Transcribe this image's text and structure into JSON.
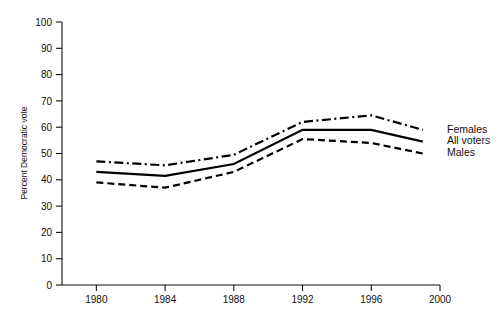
{
  "chart_data": {
    "type": "line",
    "title": "",
    "xlabel": "",
    "ylabel": "Percent Democratic vote",
    "x": [
      1980,
      1984,
      1988,
      1992,
      1996,
      1999
    ],
    "xlim": [
      1978,
      2000
    ],
    "ylim": [
      0,
      100
    ],
    "grid": false,
    "legend_position": "right-of-plot-end-labels",
    "xticks": [
      "1980",
      "1984",
      "1988",
      "1992",
      "1996",
      "2000"
    ],
    "xtick_values": [
      1980,
      1984,
      1988,
      1992,
      1996,
      2000
    ],
    "yticks": [
      "0",
      "10",
      "20",
      "30",
      "40",
      "50",
      "60",
      "70",
      "80",
      "90",
      "100"
    ],
    "ytick_values": [
      0,
      10,
      20,
      30,
      40,
      50,
      60,
      70,
      80,
      90,
      100
    ],
    "series": [
      {
        "name": "Females",
        "style": "dash-dot",
        "values": [
          47.0,
          45.5,
          49.5,
          62.0,
          64.5,
          59.0
        ]
      },
      {
        "name": "All voters",
        "style": "solid",
        "values": [
          43.0,
          41.5,
          46.0,
          59.0,
          59.0,
          54.5
        ]
      },
      {
        "name": "Males",
        "style": "dashed",
        "values": [
          39.0,
          37.0,
          43.0,
          55.5,
          54.0,
          50.0
        ]
      }
    ]
  },
  "legend": {
    "items": [
      {
        "label": "Females"
      },
      {
        "label": "All voters"
      },
      {
        "label": "Males"
      }
    ]
  },
  "colors": {
    "ink": "#111111",
    "line": "#000000",
    "background": "#ffffff"
  }
}
